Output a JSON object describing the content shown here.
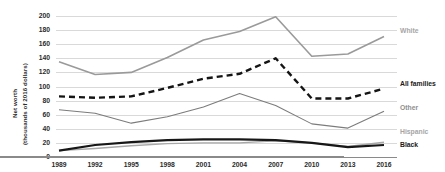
{
  "chart_data": {
    "type": "line",
    "title": "",
    "subtitle": "",
    "xlabel": "",
    "ylabel": "Net worth\n(thousands of 2016 dollars)",
    "ylabel_line1": "Net worth",
    "ylabel_line2": "(thousands of 2016 dollars)",
    "x": [
      "1989",
      "1992",
      "1995",
      "1998",
      "2001",
      "2004",
      "2007",
      "2010",
      "2013",
      "2016"
    ],
    "categories": [
      "1989",
      "1992",
      "1995",
      "1998",
      "2001",
      "2004",
      "2007",
      "2010",
      "2013",
      "2016"
    ],
    "yticks": [
      "0",
      "20",
      "40",
      "60",
      "80",
      "100",
      "120",
      "140",
      "160",
      "180",
      "200"
    ],
    "ylim": [
      0,
      200
    ],
    "xlim": [
      "1989",
      "2016"
    ],
    "grid": "horizontal",
    "legend_position": "right-end-of-line",
    "series": [
      {
        "name": "White",
        "label": "White",
        "color": "#9a9a9a",
        "style": "solid",
        "width": 1.6,
        "values": [
          135,
          117,
          120,
          141,
          166,
          178,
          199,
          143,
          146,
          171
        ]
      },
      {
        "name": "All families",
        "label": "All families",
        "color": "#141414",
        "style": "dashed",
        "width": 2.4,
        "values": [
          86,
          84,
          86,
          98,
          111,
          118,
          140,
          83,
          83,
          97
        ]
      },
      {
        "name": "Other",
        "label": "Other",
        "color": "#7c7c7c",
        "style": "solid",
        "width": 1.1,
        "values": [
          67,
          62,
          48,
          57,
          71,
          90,
          73,
          47,
          41,
          65
        ]
      },
      {
        "name": "Hispanic",
        "label": "Hispanic",
        "color": "#a8a8a8",
        "style": "solid",
        "width": 1.4,
        "values": [
          9,
          12,
          16,
          19,
          20,
          20,
          23,
          20,
          15,
          21
        ]
      },
      {
        "name": "Black",
        "label": "Black",
        "color": "#171717",
        "style": "solid",
        "width": 2.2,
        "values": [
          9,
          17,
          21,
          24,
          25,
          25,
          24,
          20,
          14,
          17
        ]
      }
    ]
  }
}
